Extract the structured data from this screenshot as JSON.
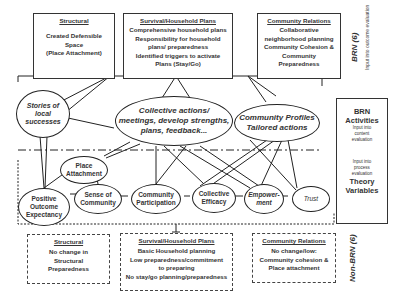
{
  "top_boxes": {
    "structural": {
      "header": "Structural",
      "lines": [
        "Created Defensible",
        "Space",
        "(Place Attachment)"
      ]
    },
    "survival": {
      "header": "Survival/Household Plans",
      "lines": [
        "Comprehensive household plans",
        "Responsibility for household",
        "plans/ preparedness",
        "Identified triggers to activate",
        "Plans (Stay/Go)"
      ]
    },
    "community": {
      "header": "Community Relations",
      "lines": [
        "Collaborative",
        "neighborhood planning",
        "Community Cohesion &",
        "Community",
        "Preparedness"
      ]
    }
  },
  "brn_label": {
    "title": "BRN (6)",
    "sub": "Input into outcome evaluation"
  },
  "activities": {
    "stories": [
      "Stories of",
      "local",
      "successes"
    ],
    "collective": [
      "Collective actions/",
      "meetings, develop strengths,",
      "plans, feedback..."
    ],
    "profiles": [
      "Community Profiles",
      "Tailored actions"
    ]
  },
  "right_panel": {
    "title1": "BRN",
    "title2": "Activities",
    "sub1": [
      "Input into",
      "content",
      "evaluation"
    ],
    "sub2": [
      "Input into",
      "process",
      "evaluation"
    ],
    "title3": "Theory",
    "title4": "Variables"
  },
  "variables": {
    "place_attachment": [
      "Place",
      "Attachment"
    ],
    "positive_outcome": [
      "Positive",
      "Outcome",
      "Expectancy"
    ],
    "sense_community": [
      "Sense of",
      "Community"
    ],
    "participation": [
      "Community",
      "Participation"
    ],
    "efficacy": [
      "Collective",
      "Efficacy"
    ],
    "empowerment": [
      "Empower-",
      "ment"
    ],
    "trust": [
      "Trust"
    ]
  },
  "bottom_boxes": {
    "structural": {
      "header": "Structural",
      "lines": [
        "No change in",
        "Structural",
        "Preparedness"
      ]
    },
    "survival": {
      "header": "Survival/Household Plans",
      "lines": [
        "Basic Household planning",
        "Low preparedness/commitment",
        "to preparing",
        "No stay/go planning/preparedness"
      ]
    },
    "community": {
      "header": "Community Relations",
      "lines": [
        "No change/low:",
        "Community cohesion &",
        "Place attachment"
      ]
    }
  },
  "non_brn_label": {
    "title": "Non-BRN (6)"
  }
}
